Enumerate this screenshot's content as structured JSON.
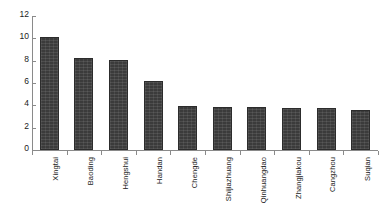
{
  "chart_data": {
    "type": "bar",
    "title": "",
    "xlabel": "",
    "ylabel": "",
    "ylim": [
      0,
      12
    ],
    "yticks": [
      0,
      2,
      4,
      6,
      8,
      10,
      12
    ],
    "grid": false,
    "legend": null,
    "bar_color": "#3b3b3b",
    "axis_color": "#8a8a8a",
    "categories": [
      "Xingtai",
      "Baoding",
      "Hengshui",
      "Handan",
      "Chengde",
      "Shijiazhuang",
      "Qinhuangdao",
      "Zhangjiakou",
      "Cangzhou",
      "Suqian"
    ],
    "values": [
      10.1,
      8.2,
      8.1,
      6.15,
      3.9,
      3.88,
      3.82,
      3.8,
      3.75,
      3.6
    ]
  }
}
